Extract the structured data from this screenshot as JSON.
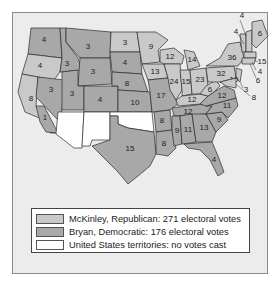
{
  "map": {
    "colors": {
      "republican": "#c9c9c9",
      "democratic": "#a8a8a8",
      "territory": "#ffffff",
      "background": "#ececec"
    },
    "states": [
      {
        "name": "Washington",
        "votes": "4",
        "party": "dem"
      },
      {
        "name": "Oregon",
        "votes": "4",
        "party": "rep"
      },
      {
        "name": "California",
        "votes": "8",
        "party": "rep"
      },
      {
        "name": "California-split",
        "votes": "1",
        "party": "dem"
      },
      {
        "name": "Idaho",
        "votes": "3",
        "party": "dem"
      },
      {
        "name": "Nevada",
        "votes": "3",
        "party": "dem"
      },
      {
        "name": "Montana",
        "votes": "3",
        "party": "dem"
      },
      {
        "name": "Wyoming",
        "votes": "3",
        "party": "dem"
      },
      {
        "name": "Utah",
        "votes": "3",
        "party": "dem"
      },
      {
        "name": "Colorado",
        "votes": "4",
        "party": "dem"
      },
      {
        "name": "North Dakota",
        "votes": "3",
        "party": "rep"
      },
      {
        "name": "South Dakota",
        "votes": "4",
        "party": "dem"
      },
      {
        "name": "Nebraska",
        "votes": "8",
        "party": "dem"
      },
      {
        "name": "Kansas",
        "votes": "10",
        "party": "dem"
      },
      {
        "name": "Texas",
        "votes": "15",
        "party": "dem"
      },
      {
        "name": "Minnesota",
        "votes": "9",
        "party": "rep"
      },
      {
        "name": "Iowa",
        "votes": "13",
        "party": "rep"
      },
      {
        "name": "Missouri",
        "votes": "17",
        "party": "dem"
      },
      {
        "name": "Arkansas",
        "votes": "8",
        "party": "dem"
      },
      {
        "name": "Louisiana",
        "votes": "8",
        "party": "dem"
      },
      {
        "name": "Wisconsin",
        "votes": "12",
        "party": "rep"
      },
      {
        "name": "Michigan",
        "votes": "14",
        "party": "rep"
      },
      {
        "name": "Illinois",
        "votes": "24",
        "party": "rep"
      },
      {
        "name": "Indiana",
        "votes": "15",
        "party": "rep"
      },
      {
        "name": "Ohio",
        "votes": "23",
        "party": "rep"
      },
      {
        "name": "Kentucky",
        "votes": "12",
        "party": "rep"
      },
      {
        "name": "Kentucky-split",
        "votes": "1",
        "party": "dem"
      },
      {
        "name": "Tennessee",
        "votes": "12",
        "party": "dem"
      },
      {
        "name": "Mississippi",
        "votes": "9",
        "party": "dem"
      },
      {
        "name": "Alabama",
        "votes": "11",
        "party": "dem"
      },
      {
        "name": "Georgia",
        "votes": "13",
        "party": "dem"
      },
      {
        "name": "Florida",
        "votes": "4",
        "party": "dem"
      },
      {
        "name": "South Carolina",
        "votes": "9",
        "party": "dem"
      },
      {
        "name": "North Carolina",
        "votes": "11",
        "party": "dem"
      },
      {
        "name": "Virginia",
        "votes": "12",
        "party": "dem"
      },
      {
        "name": "West Virginia",
        "votes": "6",
        "party": "rep"
      },
      {
        "name": "Pennsylvania",
        "votes": "32",
        "party": "rep"
      },
      {
        "name": "New York",
        "votes": "36",
        "party": "rep"
      },
      {
        "name": "New Jersey",
        "votes": "10",
        "party": "rep"
      },
      {
        "name": "Delaware",
        "votes": "3",
        "party": "rep"
      },
      {
        "name": "Maryland",
        "votes": "8",
        "party": "rep"
      },
      {
        "name": "Maine",
        "votes": "6",
        "party": "rep"
      },
      {
        "name": "New Hampshire",
        "votes": "4",
        "party": "rep"
      },
      {
        "name": "Vermont",
        "votes": "4",
        "party": "rep"
      },
      {
        "name": "Massachusetts",
        "votes": "15",
        "party": "rep"
      },
      {
        "name": "Rhode Island",
        "votes": "4",
        "party": "rep"
      },
      {
        "name": "Connecticut",
        "votes": "6",
        "party": "rep"
      },
      {
        "name": "Arizona Territory",
        "votes": "",
        "party": "ter"
      },
      {
        "name": "New Mexico Territory",
        "votes": "",
        "party": "ter"
      },
      {
        "name": "Oklahoma Territory",
        "votes": "",
        "party": "ter"
      }
    ]
  },
  "legend": {
    "items": [
      {
        "label": "McKinley, Republican: 271 electoral votes",
        "color": "#c9c9c9"
      },
      {
        "label": "Bryan, Democratic: 176 electoral votes",
        "color": "#a8a8a8"
      },
      {
        "label": "United States territories: no votes cast",
        "color": "#ffffff"
      }
    ]
  }
}
